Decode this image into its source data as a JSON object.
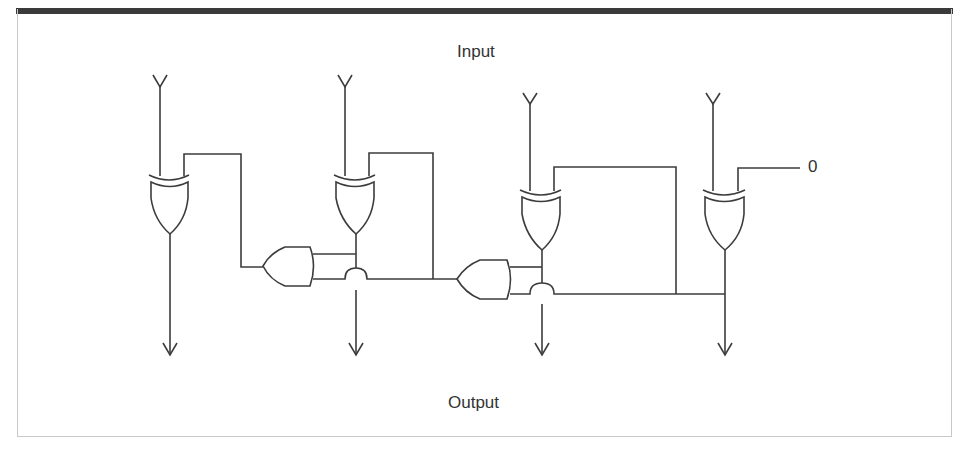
{
  "diagram": {
    "type": "logic-circuit",
    "labels": {
      "top": "Input",
      "bottom": "Output",
      "constant_input": "0"
    },
    "colors": {
      "stroke": "#3c3c3c",
      "frame_bar": "#3a3a3a",
      "frame_border": "#c8c8c8",
      "background": "#ffffff"
    },
    "gates": [
      {
        "id": "xor1",
        "type": "XOR"
      },
      {
        "id": "xor2",
        "type": "XOR"
      },
      {
        "id": "xor3",
        "type": "XOR"
      },
      {
        "id": "xor4",
        "type": "XOR"
      },
      {
        "id": "or1",
        "type": "OR"
      },
      {
        "id": "or2",
        "type": "OR"
      }
    ],
    "inputs_count": 4,
    "outputs_count": 4
  }
}
